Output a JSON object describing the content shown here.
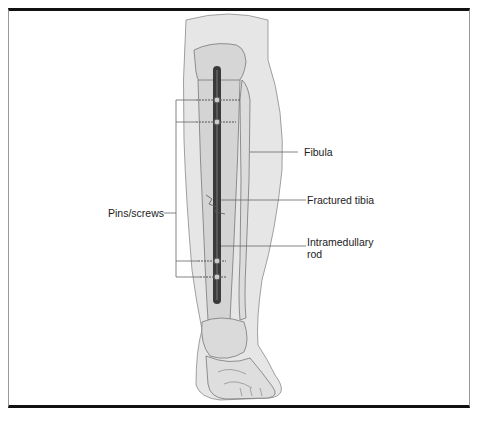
{
  "figure": {
    "labels": {
      "fibula": "Fibula",
      "fractured_tibia": "Fractured tibia",
      "intramedullary_rod_line1": "Intramedullary",
      "intramedullary_rod_line2": "rod",
      "pins_screws": "Pins/screws"
    },
    "colors": {
      "skin": "#e4e4e4",
      "bone": "#d2d2d2",
      "outline": "#6f6f6f",
      "rod": "#3a3a3a",
      "border": "#111111",
      "leader": "#666666"
    }
  }
}
